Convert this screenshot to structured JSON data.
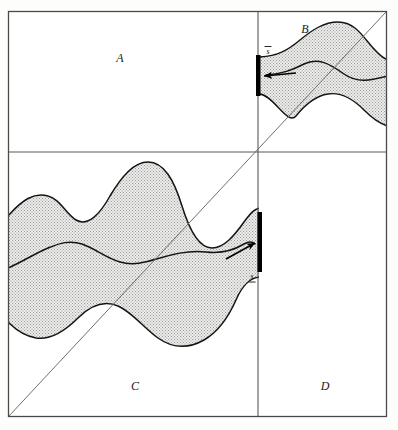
{
  "figure": {
    "background_color": "#fdfdfb",
    "frame": {
      "border_color": "#555555",
      "fill": "#ffffff",
      "x": 8,
      "y": 11,
      "width": 379,
      "height": 406
    },
    "dividers": {
      "vertical_x": 258,
      "horizontal_y": 152,
      "color": "#555555"
    },
    "diagonal": {
      "color": "#6b6b6b",
      "from": [
        8,
        417
      ],
      "to": [
        387,
        11
      ]
    },
    "quadrants": [
      {
        "key": "A",
        "label": "A",
        "position": "top-left",
        "label_x": 120,
        "label_y": 62,
        "shaded": false
      },
      {
        "key": "B",
        "label": "B",
        "position": "top-right",
        "label_x": 305,
        "label_y": 33,
        "shaded": true
      },
      {
        "key": "C",
        "label": "C",
        "position": "bottom-left",
        "label_x": 135,
        "label_y": 390,
        "shaded": true
      },
      {
        "key": "D",
        "label": "D",
        "position": "bottom-right",
        "label_x": 325,
        "label_y": 390,
        "shaded": false
      }
    ],
    "shading": {
      "pattern": "stipple-halftone",
      "dot_color": "#9a9a9a",
      "fill_color": "#e8e8e6",
      "outline_color": "#1a1a1a"
    },
    "markers": [
      {
        "name": "upper-bound-bar",
        "label": "s",
        "label_accent": "overbar",
        "quadrant": "B",
        "bar_x": 258,
        "bar_y1": 55,
        "bar_y2": 96,
        "bar_width": 4,
        "arrow_direction": "left",
        "arrow_from": [
          292,
          73
        ],
        "arrow_to": [
          263,
          75
        ],
        "label_x": 268,
        "label_y": 53,
        "color": "#000000"
      },
      {
        "name": "lower-bound-bar",
        "label": "s",
        "label_accent": "underbar",
        "quadrant": "C",
        "bar_x": 260,
        "bar_y1": 212,
        "bar_y2": 272,
        "bar_width": 4,
        "arrow_direction": "right",
        "arrow_from": [
          228,
          258
        ],
        "arrow_to": [
          256,
          243
        ],
        "label_x": 252,
        "label_y": 280,
        "color": "#000000"
      }
    ],
    "bands": [
      {
        "name": "band-upper-right",
        "quadrant": "B",
        "description": "narrow band originating at the upper-bound bar and widening toward the right frame edge",
        "upper_path": "M 260 57 C 278 56 288 50 300 40 C 312 30 324 22 338 22 C 352 22 360 32 368 42 C 376 52 382 58 387 60",
        "lower_path": "M 387 124 C 380 123 372 118 364 110 C 352 98 340 92 328 94 C 314 96 304 106 296 116 C 288 126 274 96 260 94",
        "center_path": "M 263 75 C 280 74 292 70 304 64 C 318 57 330 64 344 74 C 358 84 372 80 387 76"
      },
      {
        "name": "band-lower-left",
        "quadrant": "C",
        "description": "broad wavy band spanning the left frame edge to the lower-bound bar",
        "upper_path": "M 9 216 C 22 200 34 192 48 196 C 60 199 66 214 76 220 C 88 227 100 214 110 196 C 122 176 134 162 148 162 C 164 162 174 180 182 206 C 190 232 200 248 212 248 C 224 248 234 236 244 222 C 252 211 256 208 260 208",
        "lower_path": "M 260 277 C 250 277 242 286 236 300 C 228 318 218 332 204 340 C 188 349 172 348 158 338 C 144 328 132 312 118 306 C 104 300 90 306 78 318 C 64 332 50 340 36 338 C 24 336 16 330 9 322",
        "center_path": "M 9 268 C 22 262 34 254 48 248 C 60 243 70 240 82 244 C 96 249 106 258 120 262 C 134 266 146 262 160 258 C 176 253 190 250 206 252 C 222 254 234 250 244 244 C 250 240 254 242 256 243"
      }
    ]
  }
}
